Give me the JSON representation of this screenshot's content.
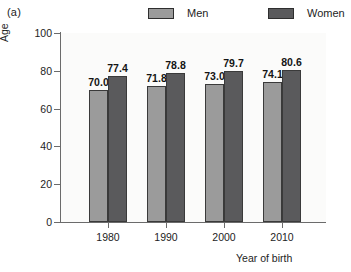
{
  "panel": {
    "label": "(a)"
  },
  "legend": {
    "entries": [
      {
        "label": "Men",
        "color": "#9b9b9b",
        "key": "men"
      },
      {
        "label": "Women",
        "color": "#5a5a5c",
        "key": "women"
      }
    ]
  },
  "axes": {
    "y_title": "Age",
    "x_title": "Year of birth",
    "y_ticks": [
      "0",
      "20",
      "40",
      "60",
      "80",
      "100"
    ]
  },
  "chart_data": {
    "type": "bar",
    "title": "",
    "subtitle": "",
    "xlabel": "Year of birth",
    "ylabel": "Age",
    "categories": [
      "1980",
      "1990",
      "2000",
      "2010"
    ],
    "series": [
      {
        "name": "Men",
        "color": "#9b9b9b",
        "values": [
          70.0,
          71.8,
          73.0,
          74.1
        ]
      },
      {
        "name": "Women",
        "color": "#5a5a5c",
        "values": [
          77.4,
          78.8,
          79.7,
          80.6
        ]
      }
    ],
    "value_labels": [
      [
        "70.0",
        "77.4"
      ],
      [
        "71.8",
        "78.8"
      ],
      [
        "73.0",
        "79.7"
      ],
      [
        "74.1",
        "80.6"
      ]
    ],
    "ylim": [
      0,
      100
    ],
    "yticks": [
      0,
      20,
      40,
      60,
      80,
      100
    ],
    "grid": false,
    "legend_position": "top",
    "panel_label": "(a)"
  }
}
